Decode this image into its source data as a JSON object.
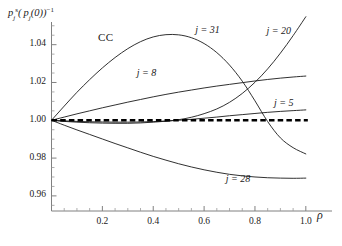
{
  "chart_data": {
    "type": "line",
    "title": "",
    "annotation": "CC",
    "ylabel": "pjs(pj(0))-1",
    "xlabel": "ρ",
    "xlim": [
      0,
      1.04
    ],
    "ylim": [
      0.952,
      1.052
    ],
    "grid": false,
    "legend_position": "inline-curve-labels",
    "xticks": [
      "0.2",
      "0.4",
      "0.6",
      "0.8",
      "1.0"
    ],
    "xtick_values": [
      0.2,
      0.4,
      0.6,
      0.8,
      1.0
    ],
    "yticks": [
      "0.96",
      "0.98",
      "1.00",
      "1.02",
      "1.04"
    ],
    "ytick_values": [
      0.96,
      0.98,
      1.0,
      1.02,
      1.04
    ],
    "reference_line": {
      "label": "unity reference",
      "y": 1.0,
      "style": "thick-dashed",
      "color": "#000000"
    },
    "series": [
      {
        "name": "j = 31",
        "label_x": 0.62,
        "label_y": 1.047,
        "x": [
          0,
          0.05,
          0.1,
          0.15,
          0.2,
          0.25,
          0.3,
          0.35,
          0.4,
          0.45,
          0.5,
          0.55,
          0.6,
          0.65,
          0.7,
          0.75,
          0.8,
          0.85,
          0.9,
          0.95,
          1.0
        ],
        "values": [
          1.0,
          1.0075,
          1.0148,
          1.0215,
          1.0277,
          1.0332,
          1.0379,
          1.0416,
          1.0441,
          1.0453,
          1.0452,
          1.0437,
          1.0406,
          1.0358,
          1.0292,
          1.0207,
          1.0103,
          0.9993,
          0.9907,
          0.9855,
          0.9822
        ]
      },
      {
        "name": "j = 20",
        "label_x": 0.9,
        "label_y": 1.0465,
        "x": [
          0,
          0.05,
          0.1,
          0.15,
          0.2,
          0.25,
          0.3,
          0.35,
          0.4,
          0.45,
          0.5,
          0.55,
          0.6,
          0.65,
          0.7,
          0.75,
          0.8,
          0.85,
          0.9,
          0.95,
          1.0
        ],
        "values": [
          1.0,
          0.9994,
          0.999,
          0.9987,
          0.9985,
          0.9984,
          0.9984,
          0.9986,
          0.999,
          0.9995,
          1.0003,
          1.0016,
          1.0035,
          1.006,
          1.0095,
          1.0142,
          1.0201,
          1.0272,
          1.0355,
          1.0448,
          1.0548
        ]
      },
      {
        "name": "j = 8",
        "label_x": 0.39,
        "label_y": 1.0245,
        "x": [
          0,
          0.05,
          0.1,
          0.15,
          0.2,
          0.25,
          0.3,
          0.35,
          0.4,
          0.45,
          0.5,
          0.55,
          0.6,
          0.65,
          0.7,
          0.75,
          0.8,
          0.85,
          0.9,
          0.95,
          1.0
        ],
        "values": [
          1.0,
          1.0017,
          1.0034,
          1.005,
          1.0066,
          1.0081,
          1.0096,
          1.011,
          1.0124,
          1.0137,
          1.0149,
          1.016,
          1.0171,
          1.0181,
          1.019,
          1.0199,
          1.0208,
          1.0216,
          1.0223,
          1.0229,
          1.0234
        ]
      },
      {
        "name": "j = 5",
        "label_x": 0.93,
        "label_y": 1.0086,
        "x": [
          0,
          0.05,
          0.1,
          0.15,
          0.2,
          0.25,
          0.3,
          0.35,
          0.4,
          0.45,
          0.5,
          0.55,
          0.6,
          0.65,
          0.7,
          0.75,
          0.8,
          0.85,
          0.9,
          0.95,
          1.0
        ],
        "values": [
          1.0,
          0.9997,
          0.9994,
          0.9992,
          0.9991,
          0.999,
          0.999,
          0.9991,
          0.9993,
          0.9996,
          1.0,
          1.0005,
          1.0011,
          1.0017,
          1.0024,
          1.003,
          1.0036,
          1.0042,
          1.0047,
          1.0051,
          1.0055
        ]
      },
      {
        "name": "j = 28",
        "label_x": 0.74,
        "label_y": 0.9685,
        "x": [
          0,
          0.05,
          0.1,
          0.15,
          0.2,
          0.25,
          0.3,
          0.35,
          0.4,
          0.45,
          0.5,
          0.55,
          0.6,
          0.65,
          0.7,
          0.75,
          0.8,
          0.85,
          0.9,
          0.95,
          1.0
        ],
        "values": [
          1.0,
          0.9974,
          0.9949,
          0.9925,
          0.9901,
          0.9877,
          0.9854,
          0.9831,
          0.9809,
          0.9789,
          0.977,
          0.9753,
          0.9738,
          0.9725,
          0.9714,
          0.9706,
          0.97,
          0.9696,
          0.9694,
          0.9693,
          0.9694
        ]
      }
    ]
  },
  "axis": {
    "y_axis_name": "value-axis",
    "x_axis_name": "rho-axis"
  }
}
